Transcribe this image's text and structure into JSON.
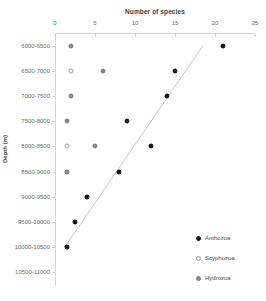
{
  "chart_data": {
    "type": "scatter",
    "title": "",
    "xlabel": "Number of species",
    "ylabel": "Depth (m)",
    "xlim": [
      0,
      25
    ],
    "xticks": [
      0,
      5,
      10,
      15,
      20,
      25
    ],
    "xtick_labels": [
      "0",
      "5",
      "10",
      "15",
      "20",
      "25"
    ],
    "categories": [
      "6000-6500",
      "6500-7000",
      "7000-7500",
      "7500-8000",
      "8000-8500",
      "8500-9000",
      "9000-9500",
      "9500-10000",
      "10000-10500",
      "10500-11000"
    ],
    "grid": false,
    "legend_position": "bottom-right",
    "series": [
      {
        "name": "Anthozoa",
        "color": "#111111",
        "marker": "filled-circle",
        "points": [
          {
            "category": "6000-6500",
            "value": 21
          },
          {
            "category": "6500-7000",
            "value": 15
          },
          {
            "category": "7000-7500",
            "value": 14
          },
          {
            "category": "7500-8000",
            "value": 9
          },
          {
            "category": "8000-8500",
            "value": 12
          },
          {
            "category": "8500-9000",
            "value": 8
          },
          {
            "category": "9000-9500",
            "value": 4
          },
          {
            "category": "9500-10000",
            "value": 2.5
          },
          {
            "category": "10000-10500",
            "value": 1.5
          }
        ]
      },
      {
        "name": "Scyphozoa",
        "color": "#ffffff",
        "marker": "open-circle",
        "points": [
          {
            "category": "6500-7000",
            "value": 2
          },
          {
            "category": "8000-8500",
            "value": 1.5
          }
        ]
      },
      {
        "name": "Hydrozoa",
        "color": "#8c8c8c",
        "marker": "gray-circle",
        "points": [
          {
            "category": "6000-6500",
            "value": 2
          },
          {
            "category": "6500-7000",
            "value": 6
          },
          {
            "category": "7000-7500",
            "value": 2
          },
          {
            "category": "7500-8000",
            "value": 1.5
          },
          {
            "category": "8000-8500",
            "value": 5
          },
          {
            "category": "8500-9000",
            "value": 1.5
          }
        ]
      }
    ],
    "trendline": {
      "color": "#c8c8c8",
      "x_start": 1.2,
      "y_start_category": "10000-10500",
      "x_end": 18.5,
      "y_end_category": "6000-6500"
    }
  },
  "legend": {
    "items": [
      {
        "label": "Anthozoa",
        "style": "anthozoa"
      },
      {
        "label": "Scyphozoa",
        "style": "scyphozoa"
      },
      {
        "label": "Hydrozoa",
        "style": "hydrozoa"
      }
    ]
  }
}
